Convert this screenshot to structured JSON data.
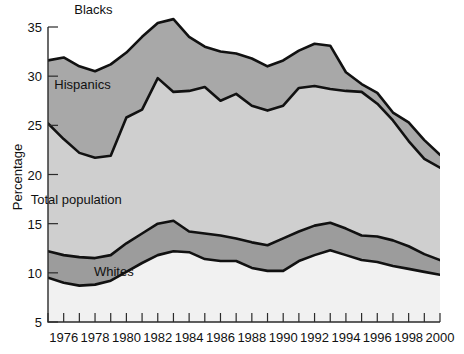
{
  "chart_data": {
    "type": "area",
    "title": "",
    "subtitle": "",
    "xlabel": "",
    "ylabel": "Percentage",
    "xlim": [
      1975,
      2000
    ],
    "ylim": [
      5,
      35
    ],
    "grid": false,
    "legend_position": "inline-labels",
    "x": [
      1975,
      1976,
      1977,
      1978,
      1979,
      1980,
      1981,
      1982,
      1983,
      1984,
      1985,
      1986,
      1987,
      1988,
      1989,
      1990,
      1991,
      1992,
      1993,
      1994,
      1995,
      1996,
      1997,
      1998,
      1999,
      2000
    ],
    "xtick_labels": [
      "1976",
      "1978",
      "1980",
      "1982",
      "1984",
      "1986",
      "1988",
      "1990",
      "1992",
      "1994",
      "1996",
      "1998",
      "2000"
    ],
    "xtick_values": [
      1976,
      1978,
      1980,
      1982,
      1984,
      1986,
      1988,
      1990,
      1992,
      1994,
      1996,
      1998,
      2000
    ],
    "ytick_labels": [
      "5",
      "10",
      "15",
      "20",
      "25",
      "30",
      "35"
    ],
    "ytick_values": [
      5,
      10,
      15,
      20,
      25,
      30,
      35
    ],
    "series": [
      {
        "name": "Blacks",
        "label": "Blacks",
        "fill": "#a8a8a8",
        "values": [
          31.6,
          31.9,
          31.0,
          30.5,
          31.2,
          32.4,
          34.0,
          35.4,
          35.8,
          34.0,
          33.0,
          32.5,
          32.3,
          31.8,
          31.0,
          31.6,
          32.6,
          33.3,
          33.1,
          30.4,
          29.2,
          28.3,
          26.3,
          25.3,
          23.5,
          22.0
        ]
      },
      {
        "name": "Hispanics",
        "label": "Hispanics",
        "fill": "#cfcfcf",
        "values": [
          25.2,
          23.6,
          22.2,
          21.7,
          21.9,
          25.8,
          26.6,
          29.8,
          28.4,
          28.5,
          28.9,
          27.5,
          28.2,
          27.0,
          26.5,
          27.0,
          28.8,
          29.0,
          28.7,
          28.5,
          28.4,
          27.2,
          25.5,
          23.4,
          21.6,
          20.7
        ]
      },
      {
        "name": "Total population",
        "label": "Total population",
        "fill": "#9c9c9c",
        "values": [
          12.2,
          11.8,
          11.6,
          11.5,
          11.8,
          13.0,
          14.0,
          15.0,
          15.3,
          14.2,
          14.0,
          13.8,
          13.5,
          13.1,
          12.8,
          13.5,
          14.2,
          14.8,
          15.1,
          14.5,
          13.8,
          13.7,
          13.3,
          12.7,
          11.9,
          11.3
        ]
      },
      {
        "name": "Whites",
        "label": "Whites",
        "fill": "#f1f1f1",
        "values": [
          9.5,
          9.0,
          8.7,
          8.8,
          9.2,
          10.1,
          11.0,
          11.8,
          12.2,
          12.1,
          11.4,
          11.2,
          11.2,
          10.5,
          10.2,
          10.2,
          11.2,
          11.8,
          12.3,
          11.8,
          11.3,
          11.1,
          10.7,
          10.4,
          10.1,
          9.8
        ]
      }
    ],
    "annotations": [
      {
        "text": "Blacks",
        "x": 1977.9,
        "y": 36.3
      },
      {
        "text": "Hispanics",
        "x": 1977.2,
        "y": 28.7
      },
      {
        "text": "Total population",
        "x": 1976.8,
        "y": 17.0
      },
      {
        "text": "Whites",
        "x": 1979.2,
        "y": 9.7
      }
    ]
  },
  "axes": {
    "y_axis_title": "Percentage"
  }
}
